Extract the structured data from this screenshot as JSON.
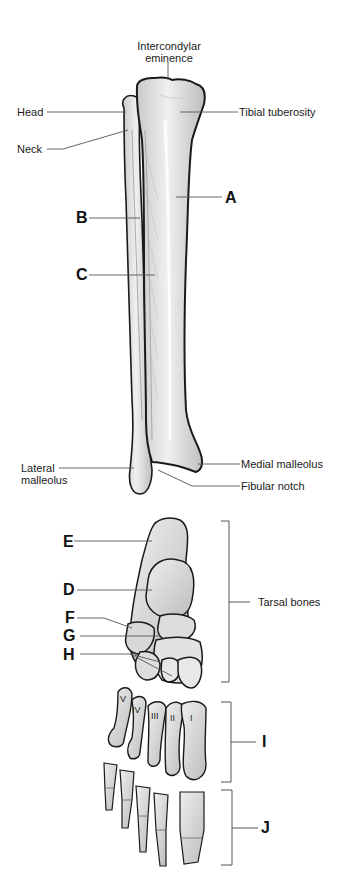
{
  "figure": {
    "leg": {
      "labels": {
        "intercondylar_eminence_line1": "Intercondylar",
        "intercondylar_eminence_line2": "eminence",
        "head": "Head",
        "neck": "Neck",
        "tibial_tuberosity": "Tibial tuberosity",
        "lateral_malleolus_line1": "Lateral",
        "lateral_malleolus_line2": "malleolus",
        "medial_malleolus": "Medial malleolus",
        "fibular_notch": "Fibular notch"
      },
      "letters": {
        "A": "A",
        "B": "B",
        "C": "C"
      }
    },
    "foot": {
      "labels": {
        "tarsal_bones": "Tarsal bones"
      },
      "letters": {
        "D": "D",
        "E": "E",
        "F": "F",
        "G": "G",
        "H": "H",
        "I": "I",
        "J": "J"
      },
      "metatarsal_numerals": [
        "I",
        "II",
        "III",
        "IV",
        "V"
      ]
    }
  },
  "colors": {
    "bone_fill": "#e6e6e6",
    "bone_shade": "#c8c8c8",
    "outline": "#1a1a1a",
    "leader_line": "#555555"
  }
}
